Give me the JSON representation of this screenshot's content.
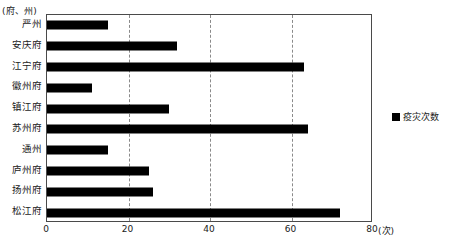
{
  "chart_data": {
    "type": "bar",
    "orientation": "horizontal",
    "title": "",
    "xlabel": "(次)",
    "ylabel": "(府、州)",
    "xlim": [
      0,
      80
    ],
    "xticks": [
      0,
      20,
      40,
      60,
      80
    ],
    "grid": "vertical-dashed",
    "legend_position": "right-outside",
    "legend": [
      "疫灾次数"
    ],
    "series_name": "疫灾次数",
    "bar_color": "#000000",
    "categories": [
      "严州",
      "安庆府",
      "江宁府",
      "徽州府",
      "镇江府",
      "苏州府",
      "通州",
      "庐州府",
      "扬州府",
      "松江府"
    ],
    "values": [
      15,
      32,
      63,
      11,
      30,
      64,
      15,
      25,
      26,
      72
    ],
    "series": [
      {
        "name": "疫灾次数",
        "values": [
          15,
          32,
          63,
          11,
          30,
          64,
          15,
          25,
          26,
          72
        ]
      }
    ]
  },
  "axes": {
    "y_unit_caption": "(府、州)",
    "x_unit_caption": "(次)",
    "xtick_labels": [
      "0",
      "20",
      "40",
      "60",
      "80"
    ]
  },
  "legend": {
    "items": [
      {
        "label": "疫灾次数",
        "color": "#000000"
      }
    ]
  }
}
